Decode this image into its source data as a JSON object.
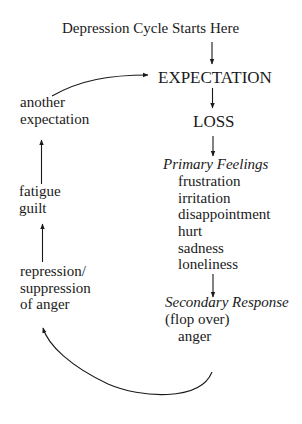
{
  "diagram": {
    "title": "Depression Cycle Starts Here",
    "nodes": {
      "expectation": "EXPECTATION",
      "loss": "LOSS",
      "primary_feelings": {
        "heading": "Primary Feelings",
        "items": [
          "frustration",
          "irritation",
          "disappointment",
          "hurt",
          "sadness",
          "loneliness"
        ]
      },
      "secondary_response": {
        "heading": "Secondary Response",
        "note": "(flop over)",
        "item": "anger"
      },
      "repression": [
        "repression/",
        "suppression",
        "of anger"
      ],
      "fatigue_guilt": [
        "fatigue",
        "guilt"
      ],
      "another_expectation": [
        "another",
        "expectation"
      ]
    },
    "edges": [
      {
        "from": "title",
        "to": "expectation"
      },
      {
        "from": "expectation",
        "to": "loss"
      },
      {
        "from": "loss",
        "to": "primary_feelings"
      },
      {
        "from": "primary_feelings",
        "to": "secondary_response"
      },
      {
        "from": "secondary_response",
        "to": "repression",
        "style": "curved"
      },
      {
        "from": "repression",
        "to": "fatigue_guilt"
      },
      {
        "from": "fatigue_guilt",
        "to": "another_expectation"
      },
      {
        "from": "another_expectation",
        "to": "expectation",
        "style": "curved"
      }
    ],
    "colors": {
      "ink": "#1a1a1a",
      "background": "#ffffff"
    }
  }
}
